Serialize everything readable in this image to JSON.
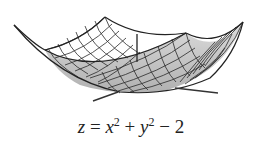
{
  "figure": {
    "type": "3d-surface-plot",
    "surface": "elliptic paraboloid",
    "caption": {
      "var_z": "z",
      "equals": " = ",
      "var_x": "x",
      "exp_x": "2",
      "plus": " + ",
      "var_y": "y",
      "exp_y": "2",
      "minus": " − ",
      "constant": "2"
    },
    "colors": {
      "mesh_line": "#2a2a2a",
      "surface_fill_front": "#c8c8c8",
      "surface_fill_back": "#ffffff",
      "axis": "#333333"
    }
  }
}
